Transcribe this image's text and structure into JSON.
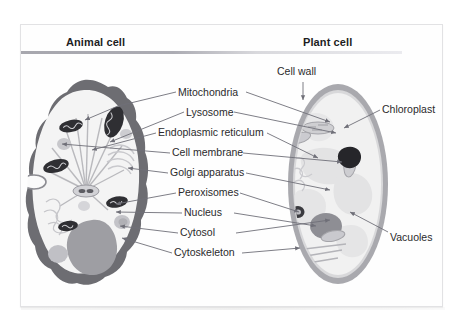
{
  "figure": {
    "kind": "biology-diagram",
    "headings": {
      "left": "Animal cell",
      "right": "Plant cell"
    }
  },
  "labels": {
    "top_plant": "Cell wall",
    "right": [
      "Chloroplast",
      "Vacuoles"
    ],
    "center": [
      "Mitochondria",
      "Lysosome",
      "Endoplasmic reticulum",
      "Cell membrane",
      "Golgi apparatus",
      "Peroxisomes",
      "Nucleus",
      "Cytosol",
      "Cytoskeleton"
    ]
  },
  "colors": {
    "page": "#ffffff",
    "panel": "#fefefe",
    "panel_border": "#e2e2e4",
    "heading_text": "#1d1d1f",
    "label_text": "#2a2a2c",
    "rule_dark": "#a7a7ae",
    "rule_light": "#ebebef",
    "leader_line": "#6f6f78",
    "animal_membrane": "#6d6d72",
    "animal_cytosol": "#f4f4f4",
    "animal_nucleus": "#9e9ea3",
    "mitochondria": "#2f2f33",
    "plant_wall": "#a9a9ae",
    "plant_cytosol": "#f1f1f1",
    "plant_nucleus": "#8e8e94",
    "chloroplast": "#26262a",
    "vacuole": "#e3e3e4"
  }
}
